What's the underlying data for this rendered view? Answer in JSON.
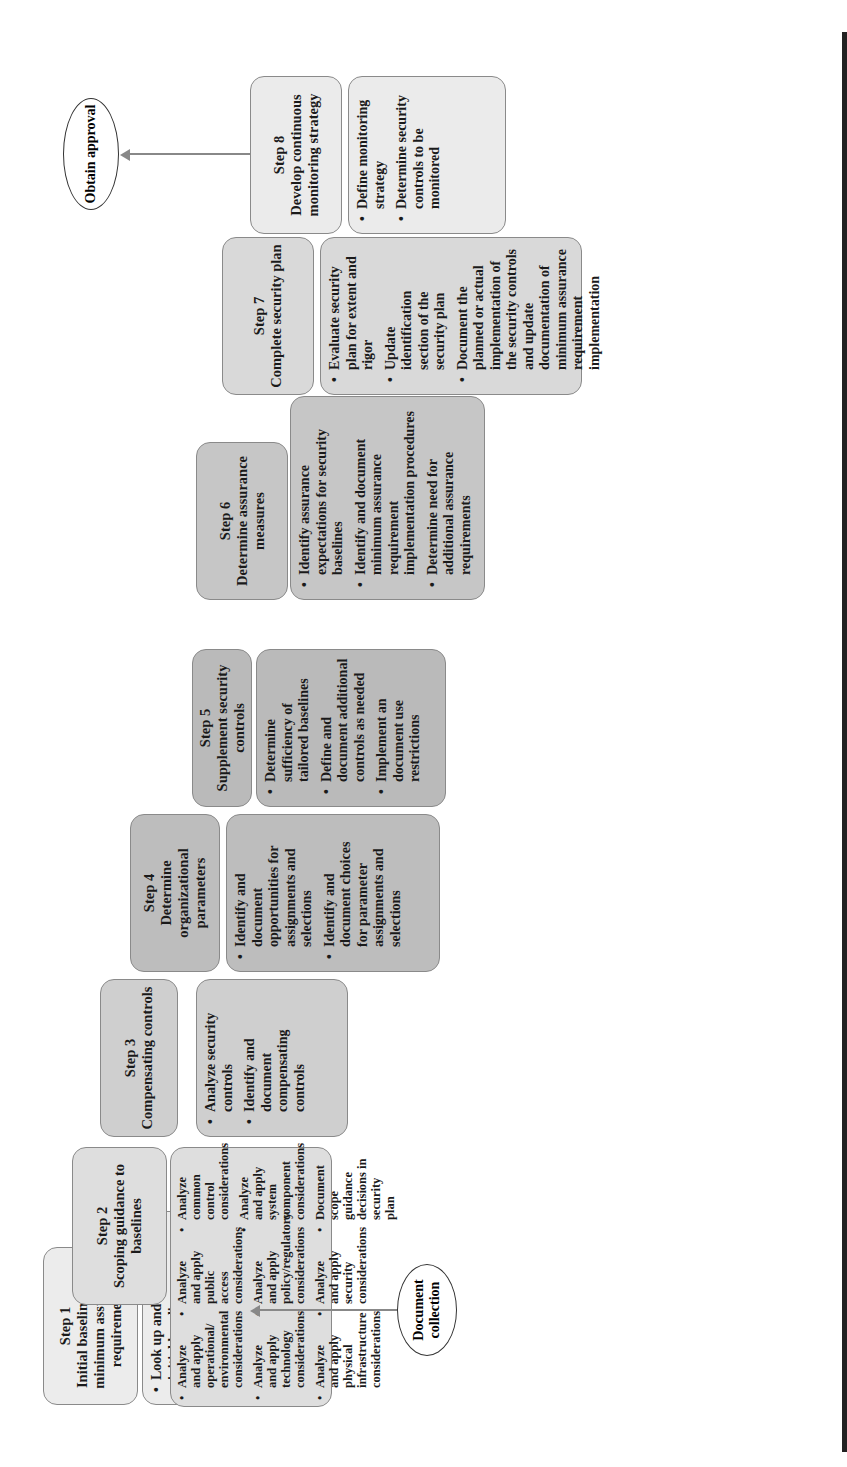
{
  "diagram": {
    "orientation": "rotated-90-ccw",
    "steps": [
      {
        "number": "Step 1",
        "title": "Initial baselines and minimum assurance requirements",
        "tasks": [
          "Look up and document initial baselines",
          "Look up and document document assurance requirements"
        ]
      },
      {
        "number": "Step 2",
        "title": "Scoping guidance to baselines",
        "tasks": [
          "Analyze and apply operational/ environmental considerations",
          "Analyze and apply technology considerations",
          "Analyze and apply physical infrastructure considerations",
          "Analyze and apply public access considerations",
          "Analyze and apply policy/regulatory considerations",
          "Analyze and apply security considerations",
          "Analyze common control considerations",
          "Analyze and apply system component considerations",
          "Document scope guidance decisions in security plan"
        ]
      },
      {
        "number": "Step 3",
        "title": "Compensating controls",
        "tasks": [
          "Analyze security controls",
          "Identify and document compensating controls"
        ]
      },
      {
        "number": "Step 4",
        "title": "Determine organizational parameters",
        "tasks": [
          "Identify and document opportunities for assignments and selections",
          "Identify and document choices for parameter assignments and selections"
        ]
      },
      {
        "number": "Step 5",
        "title": "Supplement security controls",
        "tasks": [
          "Determine sufficiency of tailored baselines",
          "Define and document additional controls as needed",
          "Implement an document use restrictions"
        ]
      },
      {
        "number": "Step 6",
        "title": "Determine assurance measures",
        "tasks": [
          "Identify assurance expectations for security baselines",
          "Identify and document minimum assurance requirement implementation procedures",
          "Determine need for additional assurance requirements"
        ]
      },
      {
        "number": "Step 7",
        "title": "Complete security plan",
        "tasks": [
          "Evaluate security plan for extent and rigor",
          "Update identification section of the security plan",
          "Document the planned or actual implementation of the security controls and update documentation of minimum assurance requirement implementation"
        ]
      },
      {
        "number": "Step 8",
        "title": "Develop continuous monitoring strategy",
        "tasks": [
          "Define monitoring strategy",
          "Determine security controls to be monitored"
        ]
      }
    ],
    "start_node": {
      "label": "Document collection"
    },
    "end_node": {
      "label": "Obtain approval"
    },
    "colors": {
      "border": "#8a8a8a",
      "arrow": "#888888",
      "rule": "#222222"
    }
  }
}
